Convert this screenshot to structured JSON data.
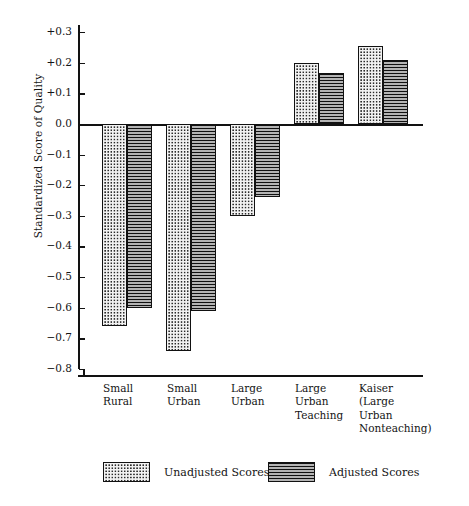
{
  "chart_data": {
    "type": "bar",
    "title": "",
    "xlabel": "",
    "ylabel": "Standardized Score of Quality",
    "ylim": [
      -0.8,
      0.3
    ],
    "grid": false,
    "legend_position": "bottom",
    "categories": [
      "Small\nRural",
      "Small\nUrban",
      "Large\nUrban",
      "Large\nUrban\nTeaching",
      "Kaiser\n(Large\nUrban\nNonteaching)"
    ],
    "ytick_labels": [
      "+0.3",
      "+0.2",
      "+0.1",
      "0.0",
      "−0.1",
      "−0.2",
      "−0.3",
      "−0.4",
      "−0.5",
      "−0.6",
      "−0.7",
      "−0.8"
    ],
    "ytick_values": [
      0.3,
      0.2,
      0.1,
      0.0,
      -0.1,
      -0.2,
      -0.3,
      -0.4,
      -0.5,
      -0.6,
      -0.7,
      -0.8
    ],
    "series": [
      {
        "name": "Unadjusted Scores",
        "pattern": "dots",
        "values": [
          -0.66,
          -0.74,
          -0.3,
          0.2,
          0.255
        ]
      },
      {
        "name": "Adjusted Scores",
        "pattern": "horizontal-lines",
        "values": [
          -0.6,
          -0.61,
          -0.24,
          0.165,
          0.21
        ]
      }
    ]
  },
  "legend": {
    "items": [
      {
        "label": "Unadjusted Scores",
        "pattern": "dots"
      },
      {
        "label": "Adjusted Scores",
        "pattern": "horizontal-lines"
      }
    ]
  },
  "colors": {
    "axis": "#121212",
    "bar_outline": "#111111",
    "dots_fill": "#f2f2f2",
    "lines_fill": "#6e6e6e",
    "background": "#ffffff",
    "text": "#141414"
  }
}
